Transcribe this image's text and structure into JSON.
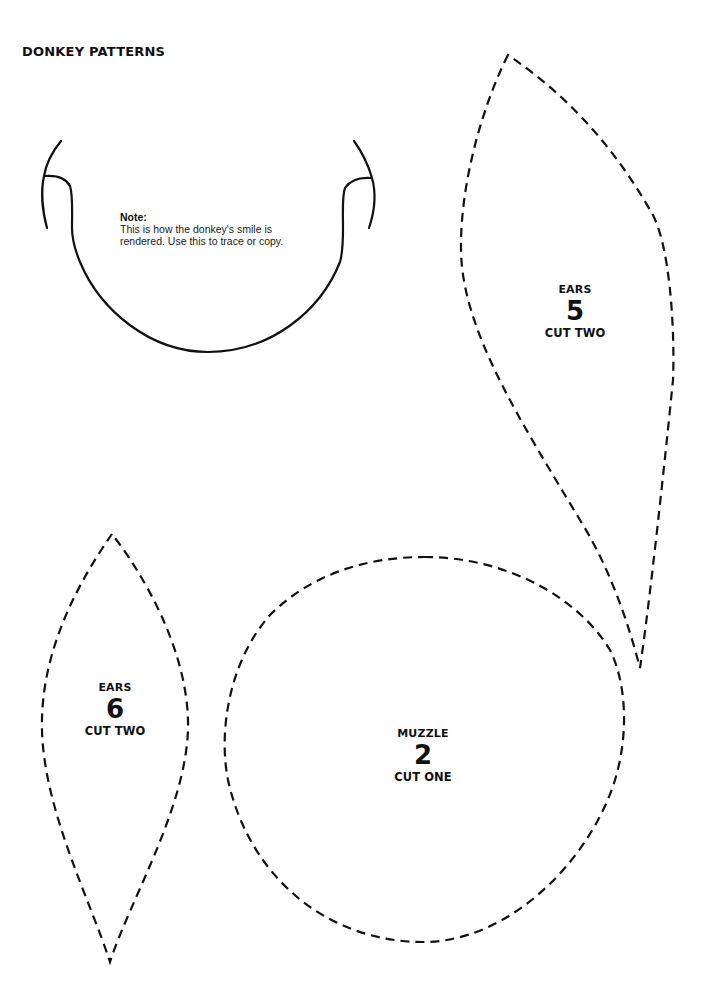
{
  "page": {
    "title": "Donkey patterns"
  },
  "smile_template": {
    "note_heading": "Note:",
    "note_text": "This is how the donkey's smile is rendered.  Use this to trace or copy."
  },
  "patterns": [
    {
      "id": "ears-5",
      "name": "EARS",
      "number": "5",
      "instruction": "CUT TWO"
    },
    {
      "id": "ears-6",
      "name": "EARS",
      "number": "6",
      "instruction": "CUT TWO"
    },
    {
      "id": "muzzle-2",
      "name": "MUZZLE",
      "number": "2",
      "instruction": "CUT ONE"
    }
  ],
  "colors": {
    "line": "#111111",
    "background": "#ffffff"
  }
}
